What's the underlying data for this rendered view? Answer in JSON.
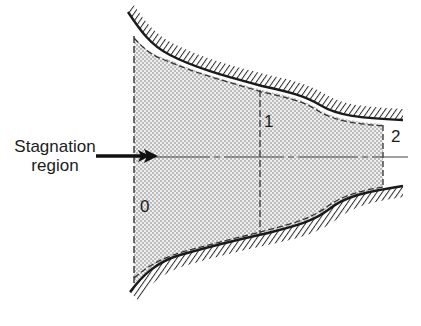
{
  "figure": {
    "labels": {
      "stagnation_line1": "Stagnation",
      "stagnation_line2": "region",
      "station_0": "0",
      "station_1": "1",
      "station_2": "2"
    },
    "colors": {
      "wall": "#1a1a1a",
      "hatch": "#2a2a2a",
      "stipple": "#7a7a7a",
      "fill": "#ececec",
      "dash": "#333333",
      "text": "#1c1c1c"
    },
    "geometry": {
      "centerline_y": 157,
      "station_x": [
        134,
        260,
        383
      ],
      "upper_wall": "M128,12 C140,30 150,45 170,55 C195,68 225,76 262,86 C290,92 305,96 320,105 C338,116 360,118 403,120",
      "lower_wall": "M130,292 C142,276 156,262 180,255 C215,245 245,238 268,233 C295,226 312,222 328,210 C345,196 365,192 403,186"
    }
  }
}
